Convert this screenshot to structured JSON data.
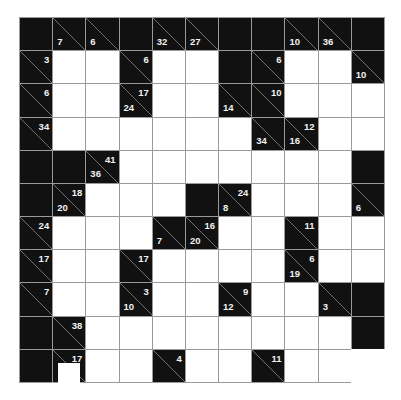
{
  "puzzle": {
    "type": "kakuro",
    "rows": 11,
    "cols": 11,
    "legend": "cell codes: D = dark blank, W = white entry cell, C = clue cell with down (lower-left) and right (upper-right) sums",
    "grid": [
      [
        {
          "t": "D"
        },
        {
          "t": "C",
          "down": "7"
        },
        {
          "t": "C",
          "down": "6"
        },
        {
          "t": "D"
        },
        {
          "t": "C",
          "down": "32"
        },
        {
          "t": "C",
          "down": "27"
        },
        {
          "t": "D"
        },
        {
          "t": "D"
        },
        {
          "t": "C",
          "down": "10"
        },
        {
          "t": "C",
          "down": "36"
        },
        {
          "t": "D"
        }
      ],
      [
        {
          "t": "C",
          "right": "3"
        },
        {
          "t": "W"
        },
        {
          "t": "W"
        },
        {
          "t": "C",
          "right": "6"
        },
        {
          "t": "W"
        },
        {
          "t": "W"
        },
        {
          "t": "D"
        },
        {
          "t": "C",
          "right": "6"
        },
        {
          "t": "W"
        },
        {
          "t": "W"
        },
        {
          "t": "C",
          "down": "10"
        }
      ],
      [
        {
          "t": "C",
          "right": "6"
        },
        {
          "t": "W"
        },
        {
          "t": "W"
        },
        {
          "t": "C",
          "down": "24",
          "right": "17"
        },
        {
          "t": "W"
        },
        {
          "t": "W"
        },
        {
          "t": "C",
          "down": "14"
        },
        {
          "t": "C",
          "right": "10"
        },
        {
          "t": "W"
        },
        {
          "t": "W"
        },
        {
          "t": "W"
        }
      ],
      [
        {
          "t": "C",
          "right": "34"
        },
        {
          "t": "W"
        },
        {
          "t": "W"
        },
        {
          "t": "W"
        },
        {
          "t": "W"
        },
        {
          "t": "W"
        },
        {
          "t": "W"
        },
        {
          "t": "C",
          "down": "34"
        },
        {
          "t": "C",
          "down": "16",
          "right": "12"
        },
        {
          "t": "W"
        },
        {
          "t": "W"
        }
      ],
      [
        {
          "t": "D"
        },
        {
          "t": "D"
        },
        {
          "t": "C",
          "down": "36",
          "right": "41"
        },
        {
          "t": "W"
        },
        {
          "t": "W"
        },
        {
          "t": "W"
        },
        {
          "t": "W"
        },
        {
          "t": "W"
        },
        {
          "t": "W"
        },
        {
          "t": "W"
        },
        {
          "t": "D"
        }
      ],
      [
        {
          "t": "D"
        },
        {
          "t": "C",
          "down": "20",
          "right": "18"
        },
        {
          "t": "W"
        },
        {
          "t": "W"
        },
        {
          "t": "W"
        },
        {
          "t": "D"
        },
        {
          "t": "C",
          "down": "8",
          "right": "24"
        },
        {
          "t": "W"
        },
        {
          "t": "W"
        },
        {
          "t": "W"
        },
        {
          "t": "C",
          "down": "6"
        }
      ],
      [
        {
          "t": "C",
          "right": "24"
        },
        {
          "t": "W"
        },
        {
          "t": "W"
        },
        {
          "t": "W"
        },
        {
          "t": "C",
          "down": "7"
        },
        {
          "t": "C",
          "down": "20",
          "right": "16"
        },
        {
          "t": "W"
        },
        {
          "t": "W"
        },
        {
          "t": "C",
          "right": "11"
        },
        {
          "t": "W"
        },
        {
          "t": "W"
        }
      ],
      [
        {
          "t": "C",
          "right": "17"
        },
        {
          "t": "W"
        },
        {
          "t": "W"
        },
        {
          "t": "C",
          "right": "17"
        },
        {
          "t": "W"
        },
        {
          "t": "W"
        },
        {
          "t": "W"
        },
        {
          "t": "W"
        },
        {
          "t": "C",
          "down": "19",
          "right": "6"
        },
        {
          "t": "W"
        },
        {
          "t": "W"
        }
      ],
      [
        {
          "t": "C",
          "right": "7"
        },
        {
          "t": "W"
        },
        {
          "t": "W"
        },
        {
          "t": "C",
          "down": "10",
          "right": "3"
        },
        {
          "t": "W"
        },
        {
          "t": "W"
        },
        {
          "t": "C",
          "down": "12",
          "right": "9"
        },
        {
          "t": "W"
        },
        {
          "t": "W"
        },
        {
          "t": "C",
          "down": "3"
        },
        {
          "t": "D"
        }
      ],
      [
        {
          "t": "D"
        },
        {
          "t": "C",
          "right": "38"
        },
        {
          "t": "W"
        },
        {
          "t": "W"
        },
        {
          "t": "W"
        },
        {
          "t": "W"
        },
        {
          "t": "W"
        },
        {
          "t": "W"
        },
        {
          "t": "W"
        },
        {
          "t": "W"
        },
        {
          "t": "D"
        }
      ],
      [
        {
          "t": "D"
        },
        {
          "t": "C",
          "right": "17"
        },
        {
          "t": "W"
        },
        {
          "t": "W"
        },
        {
          "t": "C",
          "right": "4"
        },
        {
          "t": "W"
        },
        {
          "t": "W"
        },
        {
          "t": "C",
          "right": "11"
        },
        {
          "t": "W"
        },
        {
          "t": "W"
        },
        {
          "t": "W",
          "noborder": true
        }
      ]
    ]
  },
  "colors": {
    "dark_cell": "#111111",
    "white_cell": "#ffffff",
    "grid_line": "#9a9a9a",
    "clue_text": "#f2f2f2",
    "diagonal": "#8a8a8a"
  }
}
